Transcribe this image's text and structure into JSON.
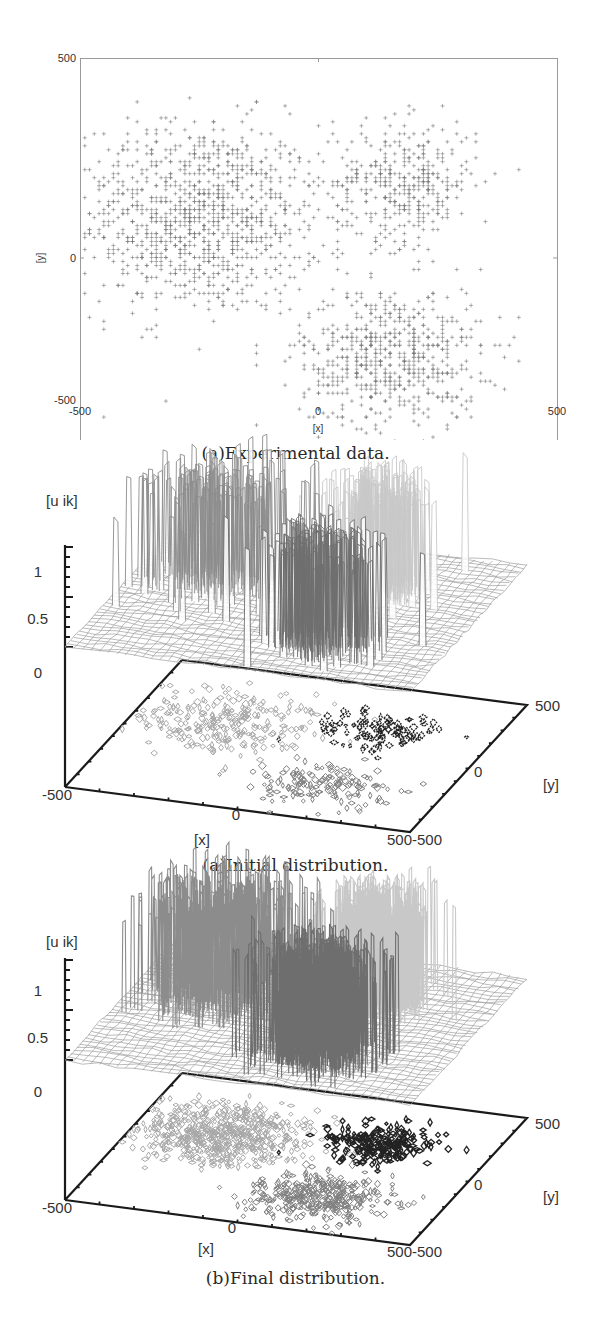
{
  "figures": [
    {
      "id": "scatter",
      "caption": "(a)Experimental data.",
      "xlabel": "[x]",
      "ylabel": "[y]",
      "xticks": [
        "-500",
        "0",
        "500"
      ],
      "yticks": [
        "500",
        "0",
        "-500"
      ]
    },
    {
      "id": "initial",
      "caption": "(a)Initial distribution.",
      "zlabel": "[u ik]",
      "zticks": [
        "1",
        "0.5",
        "0"
      ],
      "xlabel": "[x]",
      "ylabel": "[y]",
      "xticks": [
        "-500",
        "0",
        "500"
      ],
      "yticks": [
        "-500",
        "0",
        "500"
      ]
    },
    {
      "id": "final",
      "caption": "(b)Final distribution.",
      "zlabel": "[u ik]",
      "zticks": [
        "1",
        "0.5",
        "0"
      ],
      "xlabel": "[x]",
      "ylabel": "[y]",
      "xticks": [
        "-500",
        "0",
        "500"
      ],
      "yticks": [
        "-500",
        "0",
        "500"
      ]
    }
  ],
  "colors": {
    "scatter_point": "#7a7a7a",
    "axis": "#1a1a1a",
    "frame": "#9a9a9a",
    "cluster1": "#8c8c8c",
    "cluster2": "#c8c8c8",
    "cluster3": "#6e6e6e",
    "contour1": "#a8a8a8",
    "contour2": "#222222",
    "contour3": "#808080",
    "mesh": "#9e9e9e"
  },
  "chart_data": [
    {
      "type": "scatter",
      "title": "(a)Experimental data.",
      "xlabel": "[x]",
      "ylabel": "[y]",
      "xlim": [
        -500,
        500
      ],
      "ylim": [
        -500,
        500
      ],
      "grid": false,
      "marker": "+",
      "series": [
        {
          "name": "cluster 1",
          "center": [
            -250,
            100
          ],
          "spread": [
            130,
            120
          ],
          "count": 1100,
          "approx_extent": {
            "x": [
              -500,
              20
            ],
            "y": [
              -250,
              400
            ]
          }
        },
        {
          "name": "cluster 2",
          "center": [
            180,
            190
          ],
          "spread": [
            75,
            75
          ],
          "count": 380,
          "approx_extent": {
            "x": [
              30,
              380
            ],
            "y": [
              20,
              360
            ]
          }
        },
        {
          "name": "cluster 3",
          "center": [
            150,
            -250
          ],
          "spread": [
            95,
            90
          ],
          "count": 620,
          "approx_extent": {
            "x": [
              -60,
              400
            ],
            "y": [
              -480,
              -20
            ]
          }
        }
      ],
      "grid_step": 10
    },
    {
      "type": "surface",
      "title": "(a)Initial distribution.",
      "xlabel": "[x]",
      "ylabel": "[y]",
      "zlabel": "[u ik]",
      "xlim": [
        -500,
        500
      ],
      "ylim": [
        -500,
        500
      ],
      "zlim": [
        0,
        1
      ],
      "zticks": [
        0,
        0.5,
        1
      ],
      "description": "Membership u_ik per cluster over x-y grid; initial memberships are noisy spikes near 1 within each cluster region, with contour projection on base plane",
      "series": [
        {
          "name": "cluster 1",
          "region_center": [
            -250,
            100
          ],
          "peak": 1.0,
          "color": "#8c8c8c"
        },
        {
          "name": "cluster 2",
          "region_center": [
            180,
            190
          ],
          "peak": 1.0,
          "color": "#c8c8c8"
        },
        {
          "name": "cluster 3",
          "region_center": [
            150,
            -250
          ],
          "peak": 1.0,
          "color": "#6e6e6e"
        }
      ]
    },
    {
      "type": "surface",
      "title": "(b)Final distribution.",
      "xlabel": "[x]",
      "ylabel": "[y]",
      "zlabel": "[u ik]",
      "xlim": [
        -500,
        500
      ],
      "ylim": [
        -500,
        500
      ],
      "zlim": [
        0,
        1
      ],
      "zticks": [
        0,
        0.5,
        1
      ],
      "description": "Final membership distributions; denser spikes per cluster region with filled contour projection on base plane",
      "series": [
        {
          "name": "cluster 1",
          "region_center": [
            -250,
            100
          ],
          "peak": 1.0,
          "color": "#8c8c8c"
        },
        {
          "name": "cluster 2",
          "region_center": [
            180,
            190
          ],
          "peak": 1.0,
          "color": "#c8c8c8"
        },
        {
          "name": "cluster 3",
          "region_center": [
            150,
            -250
          ],
          "peak": 1.0,
          "color": "#6e6e6e"
        }
      ]
    }
  ]
}
